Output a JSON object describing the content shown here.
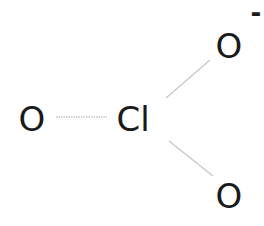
{
  "molecule": {
    "atoms": [
      {
        "id": "o-left",
        "symbol": "O",
        "x": 32,
        "y": 119
      },
      {
        "id": "cl",
        "symbol": "Cl",
        "x": 133,
        "y": 119
      },
      {
        "id": "o-top",
        "symbol": "O",
        "x": 229,
        "y": 46
      },
      {
        "id": "o-bottom",
        "symbol": "O",
        "x": 229,
        "y": 196
      }
    ],
    "charge": {
      "atom": "o-top",
      "symbol": "-",
      "x": 256,
      "y": 13
    },
    "bonds": [
      {
        "from": "cl",
        "to": "o-left",
        "x1": 56,
        "y1": 117,
        "x2": 107,
        "y2": 117
      },
      {
        "from": "cl",
        "to": "o-top",
        "x1": 166,
        "y1": 98,
        "x2": 210,
        "y2": 60
      },
      {
        "from": "cl",
        "to": "o-bottom",
        "x1": 169,
        "y1": 141,
        "x2": 213,
        "y2": 176
      }
    ],
    "bond_color": "#c8c8c8"
  }
}
